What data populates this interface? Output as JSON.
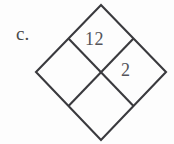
{
  "figure": {
    "label": "c.",
    "shape_name": "diamond-grid",
    "background_color": "#fdfdfd",
    "stroke_color": "#3a3a3e",
    "stroke_width": 2.1,
    "text_color": "#54545a",
    "outer_diamond": {
      "top": [
        101,
        5
      ],
      "left": [
        36,
        72
      ],
      "right": [
        166,
        72
      ],
      "bottom": [
        101,
        140
      ]
    },
    "edge_midpoints": {
      "top_left": [
        68.5,
        38.5
      ],
      "top_right": [
        133.5,
        38.5
      ],
      "bottom_left": [
        68.5,
        106
      ],
      "bottom_right": [
        133.5,
        106
      ]
    },
    "center": [
      101,
      72
    ],
    "cells": [
      {
        "position": "top",
        "value": "12"
      },
      {
        "position": "right",
        "value": "2"
      },
      {
        "position": "left",
        "value": ""
      },
      {
        "position": "bottom",
        "value": ""
      }
    ],
    "values": {
      "top": "12",
      "right": "2"
    }
  }
}
